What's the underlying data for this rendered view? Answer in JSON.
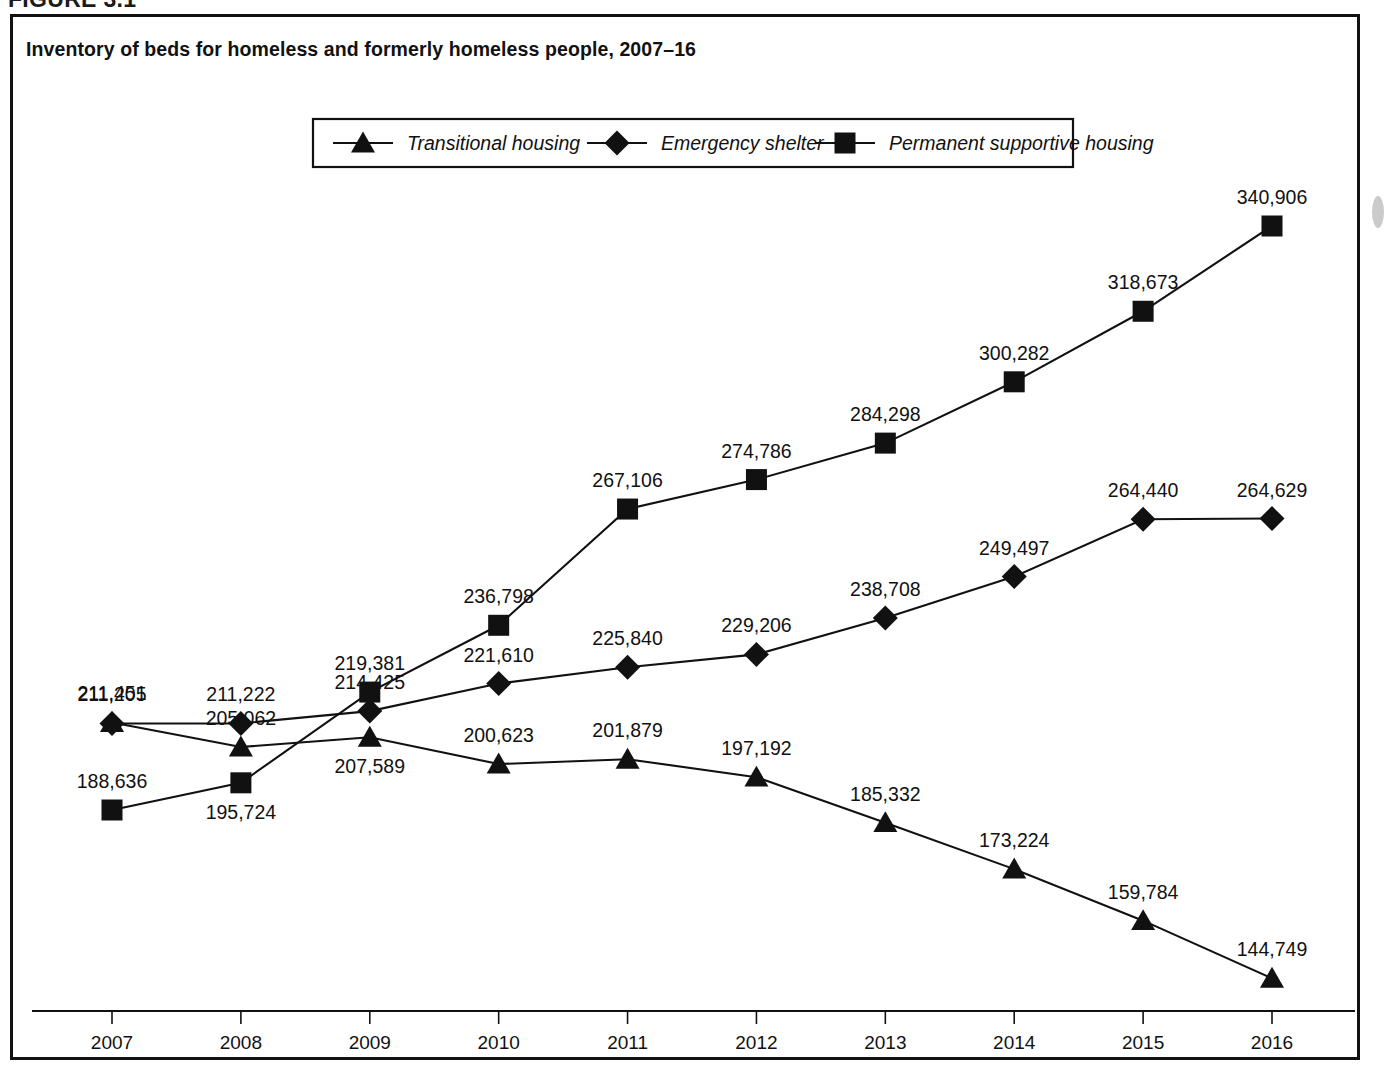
{
  "figure": {
    "number_label": "FIGURE 3.1",
    "title": "Inventory of beds for homeless and formerly homeless people, 2007–16"
  },
  "legend": {
    "position": "top-center",
    "entries": [
      {
        "label": "Transitional housing",
        "marker": "triangle-marker"
      },
      {
        "label": "Emergency shelter",
        "marker": "diamond-marker"
      },
      {
        "label": "Permanent supportive housing",
        "marker": "square-marker"
      }
    ]
  },
  "axis": {
    "x_tick_labels": [
      "2007",
      "2008",
      "2009",
      "2010",
      "2011",
      "2012",
      "2013",
      "2014",
      "2015",
      "2016"
    ],
    "y_axis_visible": false,
    "grid": false
  },
  "colors": {
    "ink": "#111111",
    "background": "#ffffff"
  },
  "chart_data": {
    "type": "line",
    "title": "Inventory of beds for homeless and formerly homeless people, 2007–16",
    "xlabel": "",
    "ylabel": "",
    "categories": [
      "2007",
      "2008",
      "2009",
      "2010",
      "2011",
      "2012",
      "2013",
      "2014",
      "2015",
      "2016"
    ],
    "x": [
      2007,
      2008,
      2009,
      2010,
      2011,
      2012,
      2013,
      2014,
      2015,
      2016
    ],
    "ylim": [
      130000,
      355000
    ],
    "grid": false,
    "legend_position": "top-center",
    "data_labels": true,
    "series": [
      {
        "name": "Transitional housing",
        "marker": "triangle",
        "values": [
          211451,
          205062,
          207589,
          200623,
          201879,
          197192,
          185332,
          173224,
          159784,
          144749
        ],
        "labels": [
          "211,451",
          "205,062",
          "207,589",
          "200,623",
          "201,879",
          "197,192",
          "185,332",
          "173,224",
          "159,784",
          "144,749"
        ],
        "label_positions": [
          "above",
          "above",
          "below",
          "above",
          "above",
          "above",
          "above",
          "above",
          "above",
          "above"
        ]
      },
      {
        "name": "Emergency shelter",
        "marker": "diamond",
        "values": [
          211205,
          211222,
          214425,
          221610,
          225840,
          229206,
          238708,
          249497,
          264440,
          264629
        ],
        "labels": [
          "211,205",
          "211,222",
          "214,425",
          "221,610",
          "225,840",
          "229,206",
          "238,708",
          "249,497",
          "264,440",
          "264,629"
        ],
        "label_positions": [
          "above",
          "above",
          "above",
          "above",
          "above",
          "above",
          "above",
          "above",
          "above",
          "above"
        ]
      },
      {
        "name": "Permanent supportive housing",
        "marker": "square",
        "values": [
          188636,
          195724,
          219381,
          236798,
          267106,
          274786,
          284298,
          300282,
          318673,
          340906
        ],
        "labels": [
          "188,636",
          "195,724",
          "219,381",
          "236,798",
          "267,106",
          "274,786",
          "284,298",
          "300,282",
          "318,673",
          "340,906"
        ],
        "label_positions": [
          "above",
          "below",
          "above",
          "above",
          "above",
          "above",
          "above",
          "above",
          "above",
          "above"
        ]
      }
    ]
  }
}
